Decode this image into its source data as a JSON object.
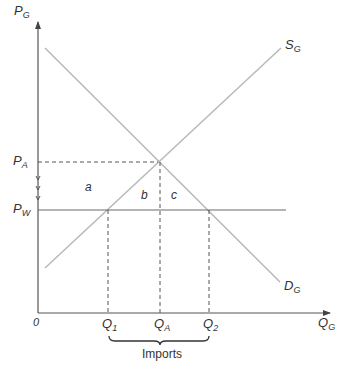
{
  "diagram": {
    "type": "supply-demand",
    "colors": {
      "axis": "#555555",
      "curve": "#b8b8b8",
      "world_price_line": "#6a6a6a",
      "dashed": "#555555",
      "text": "#333333"
    },
    "axes": {
      "y_label": "P",
      "y_label_sub": "G",
      "x_label": "Q",
      "x_label_sub": "G",
      "origin": "0"
    },
    "curves": {
      "supply": {
        "label": "S",
        "sub": "G"
      },
      "demand": {
        "label": "D",
        "sub": "G"
      }
    },
    "price_levels": {
      "autarky": {
        "label": "P",
        "sub": "A"
      },
      "world": {
        "label": "P",
        "sub": "W"
      }
    },
    "quantities": [
      {
        "label": "Q",
        "sub": "1"
      },
      {
        "label": "Q",
        "sub": "A"
      },
      {
        "label": "Q",
        "sub": "2"
      }
    ],
    "regions": [
      "a",
      "b",
      "c"
    ],
    "bracket_label": "Imports"
  }
}
